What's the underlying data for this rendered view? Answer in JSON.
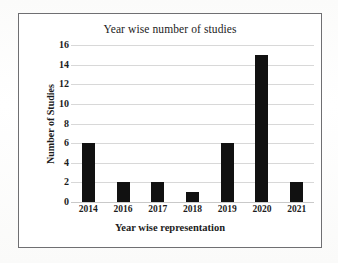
{
  "chart_data": {
    "type": "bar",
    "title": "Year wise number of studies",
    "xlabel": "Year wise representation",
    "ylabel": "Number of Studies",
    "categories": [
      "2014",
      "2016",
      "2017",
      "2018",
      "2019",
      "2020",
      "2021"
    ],
    "values": [
      6,
      2,
      2,
      1,
      6,
      15,
      2
    ],
    "ylim": [
      0,
      16
    ],
    "yticks": [
      0,
      2,
      4,
      6,
      8,
      10,
      12,
      14,
      16
    ],
    "ytick_labels": [
      "0",
      "2",
      "4",
      "6",
      "8",
      "10",
      "12",
      "14",
      "16"
    ],
    "grid": true,
    "grid_axis": "y",
    "legend": false,
    "bar_color": "#111111",
    "grid_color": "#d8d8d8",
    "frame_color": "#6f6f72",
    "background": "#ffffff"
  }
}
